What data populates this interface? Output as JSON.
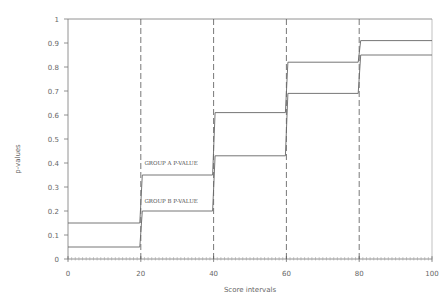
{
  "chart_data": {
    "type": "line",
    "title": "",
    "xlabel": "Score intervals",
    "ylabel": "p-values",
    "xlim": [
      0,
      100
    ],
    "ylim": [
      0,
      1
    ],
    "x_ticks": [
      0,
      20,
      40,
      60,
      80,
      100
    ],
    "x_tick_labels": [
      "0",
      "20",
      "40",
      "60",
      "80",
      "100"
    ],
    "y_ticks": [
      0,
      0.1,
      0.2,
      0.3,
      0.4,
      0.5,
      0.6,
      0.7,
      0.8,
      0.9,
      1
    ],
    "y_tick_labels": [
      "0",
      "0.1",
      "0.2",
      "0.3",
      "0.4",
      "0.5",
      "0.6",
      "0.7",
      "0.8",
      "0.9",
      "1"
    ],
    "interval_boundaries": [
      20,
      40,
      60,
      80
    ],
    "step_intervals": [
      [
        0,
        20
      ],
      [
        20,
        40
      ],
      [
        40,
        60
      ],
      [
        60,
        80
      ],
      [
        80,
        100
      ]
    ],
    "series": [
      {
        "name": "GROUP A P-VALUE",
        "values": [
          0.15,
          0.35,
          0.61,
          0.82,
          0.91
        ]
      },
      {
        "name": "GROUP B P-VALUE",
        "values": [
          0.05,
          0.2,
          0.43,
          0.69,
          0.85
        ]
      }
    ],
    "reference_line": {
      "y": 1
    },
    "annotations": [
      {
        "text": "GROUP A P-VALUE",
        "x": 21,
        "y": 0.39
      },
      {
        "text": "GROUP B P-VALUE",
        "x": 21,
        "y": 0.235
      }
    ],
    "grid": false,
    "legend": "none"
  }
}
